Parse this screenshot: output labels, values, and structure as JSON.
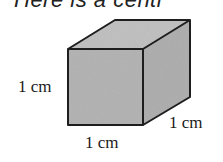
{
  "caption": "Here is a centi",
  "cube": {
    "fill_front": "#b5b5b5",
    "fill_top": "#c2c2c2",
    "fill_side": "#b0b0b0",
    "stroke": "#1e1e1e"
  },
  "labels": {
    "height": "1 cm",
    "width": "1 cm",
    "depth": "1 cm"
  }
}
